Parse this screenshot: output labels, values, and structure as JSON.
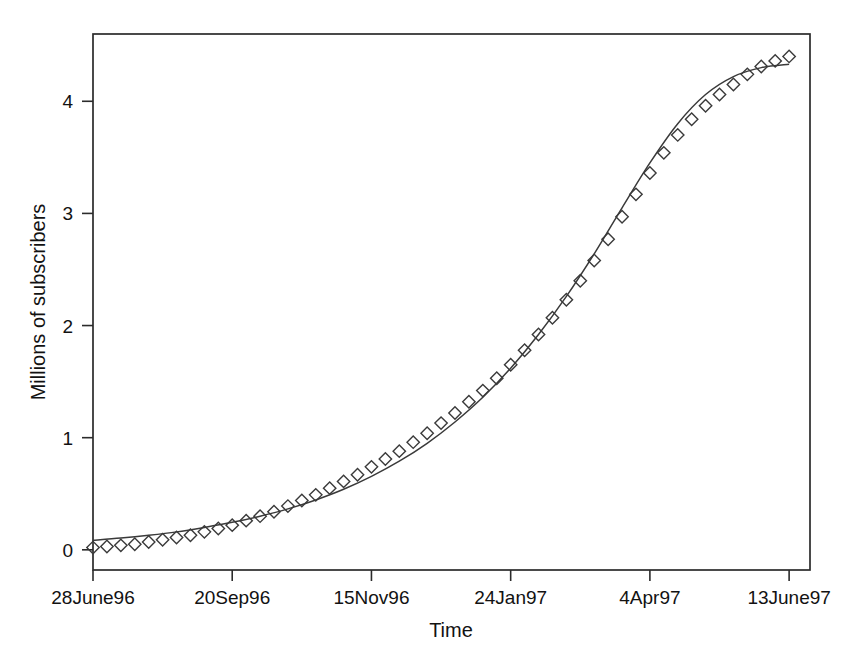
{
  "figure": {
    "name": "subscriber-growth-chart",
    "background_color": "#ffffff",
    "ink_color": "#2b2b2b"
  },
  "chart_data": {
    "type": "scatter",
    "title": "",
    "subtitle": "",
    "xlabel": "Time",
    "ylabel": "Millions of subscribers",
    "grid": false,
    "legend": "none",
    "xlim": [
      0,
      51.5
    ],
    "ylim": [
      -0.18,
      4.6
    ],
    "x_tick_labels": [
      "28June96",
      "20Sep96",
      "15Nov96",
      "24Jan97",
      "4Apr97",
      "13June97"
    ],
    "x_tick_positions": [
      0,
      10,
      20,
      30,
      40,
      50
    ],
    "y_tick_labels": [
      "0",
      "1",
      "2",
      "3",
      "4"
    ],
    "y_tick_positions": [
      0,
      1,
      2,
      3,
      4
    ],
    "series": [
      {
        "name": "Observed subscribers",
        "style": "diamond-markers",
        "x": [
          0,
          1,
          2,
          3,
          4,
          5,
          6,
          7,
          8,
          9,
          10,
          11,
          12,
          13,
          14,
          15,
          16,
          17,
          18,
          19,
          20,
          21,
          22,
          23,
          24,
          25,
          26,
          27,
          28,
          29,
          30,
          31,
          32,
          33,
          34,
          35,
          36,
          37,
          38,
          39,
          40,
          41,
          42,
          43,
          44,
          45,
          46,
          47,
          48,
          49,
          50
        ],
        "values": [
          0.02,
          0.03,
          0.04,
          0.05,
          0.07,
          0.09,
          0.11,
          0.13,
          0.16,
          0.19,
          0.22,
          0.26,
          0.3,
          0.34,
          0.39,
          0.44,
          0.49,
          0.55,
          0.61,
          0.67,
          0.74,
          0.81,
          0.88,
          0.96,
          1.04,
          1.13,
          1.22,
          1.32,
          1.42,
          1.53,
          1.65,
          1.78,
          1.92,
          2.07,
          2.23,
          2.4,
          2.58,
          2.77,
          2.97,
          3.17,
          3.36,
          3.54,
          3.7,
          3.84,
          3.96,
          4.06,
          4.15,
          4.24,
          4.31,
          4.36,
          4.4
        ]
      },
      {
        "name": "Fitted exponential curve",
        "style": "line",
        "x": [
          0,
          2,
          4,
          6,
          8,
          10,
          12,
          14,
          16,
          18,
          20,
          22,
          24,
          26,
          28,
          30,
          32,
          34,
          36,
          38,
          40,
          42,
          44,
          46,
          48,
          50
        ],
        "values": [
          0.085,
          0.105,
          0.13,
          0.16,
          0.2,
          0.245,
          0.3,
          0.365,
          0.445,
          0.54,
          0.655,
          0.79,
          0.95,
          1.14,
          1.36,
          1.62,
          1.92,
          2.26,
          2.64,
          3.05,
          3.45,
          3.8,
          4.06,
          4.22,
          4.3,
          4.33
        ]
      }
    ]
  }
}
